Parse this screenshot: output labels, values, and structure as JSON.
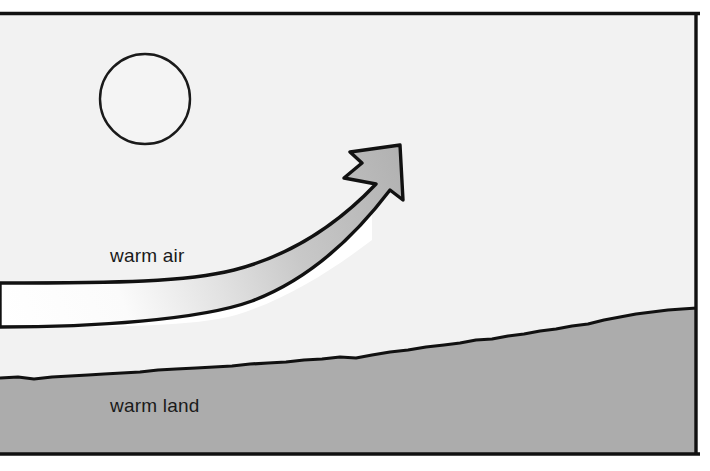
{
  "diagram": {
    "type": "convection-cross-section",
    "labels": {
      "warm_air": "warm air",
      "warm_land": "warm land"
    },
    "elements": {
      "sun": "sun-circle",
      "arrow": "rising-air-arrow",
      "air_channel": "warm-air-channel",
      "land": "warm-land-terrain",
      "frame": "diagram-frame"
    },
    "colors": {
      "sky": "#f2f2f2",
      "land": "#acacac",
      "outline": "#111111",
      "air_channel": "#ffffff",
      "arrow_start": "#ffffff",
      "arrow_end": "#b4b4b4",
      "text": "#1a1a1a",
      "page": "#ffffff"
    },
    "geometry": {
      "frame": {
        "x": 0,
        "y": 12,
        "width": 697,
        "height": 443
      },
      "sun": {
        "cx": 145,
        "cy": 99,
        "r": 45
      },
      "air_channel": {
        "top_y": 283,
        "bottom_y": 327,
        "left_x": 0,
        "right_x": 222
      },
      "land_left_y": 378,
      "land_right_y": 308,
      "arrow_tip": {
        "x": 400,
        "y": 145
      }
    },
    "label_positions": {
      "warm_air": {
        "x": 110,
        "y": 262
      },
      "warm_land": {
        "x": 110,
        "y": 412
      }
    }
  }
}
